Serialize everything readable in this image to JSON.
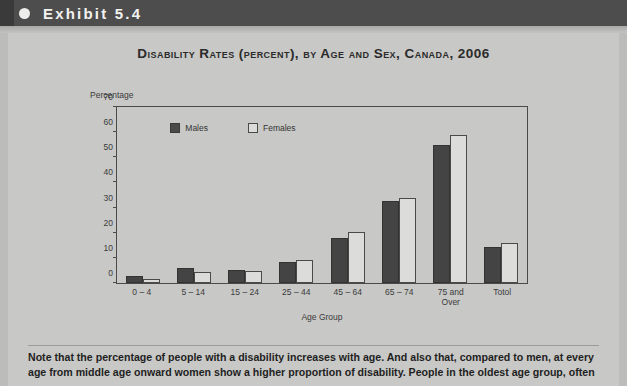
{
  "header": {
    "bullet_icon": "bullet-dot-icon",
    "exhibit_label": "Exhibit 5.4"
  },
  "figure": {
    "title": "Disability Rates (percent), by Age and Sex, Canada, 2006"
  },
  "note": {
    "text": "Note that the percentage of people with a disability increases with age. And also that, compared to men, at every age from middle age onward women show a higher proportion of disability. People in the oldest age group, often"
  },
  "colors": {
    "header_bar": "#4d4d4d",
    "page_background": "#c8c8c6",
    "males_bar": "#444444",
    "females_bar": "#dcdcda",
    "axis": "#4a4a4a",
    "text": "#2b2b2b"
  },
  "chart_data": {
    "type": "bar",
    "title": "Disability Rates (percent), by Age and Sex, Canada, 2006",
    "xlabel": "Age Group",
    "ylabel": "Percentage",
    "categories": [
      "0 – 4",
      "5 – 14",
      "15 – 24",
      "25 – 44",
      "45 – 64",
      "65 – 74",
      "75 and Over",
      "Totol"
    ],
    "series": [
      {
        "name": "Males",
        "values": [
          2.0,
          5.0,
          4.5,
          7.5,
          17.0,
          32.0,
          54.0,
          13.5
        ]
      },
      {
        "name": "Females",
        "values": [
          1.0,
          3.5,
          4.0,
          8.5,
          19.5,
          33.0,
          58.0,
          15.0
        ]
      }
    ],
    "ylim": [
      0,
      70
    ],
    "yticks": [
      0,
      10,
      20,
      30,
      40,
      50,
      60,
      70
    ],
    "grid": false,
    "legend_position": "upper-left-inside"
  }
}
